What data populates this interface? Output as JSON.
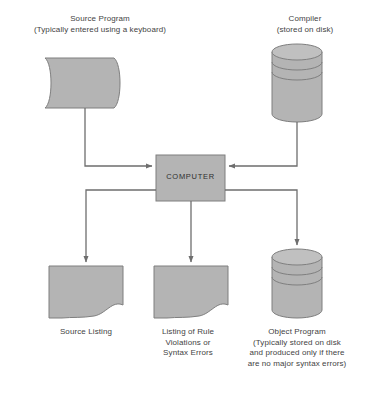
{
  "diagram": {
    "colors": {
      "shape_fill": "#b4b4b4",
      "shape_stroke": "#7f7f7f",
      "connector": "#6e6e6e",
      "text": "#434343",
      "background": "#ffffff"
    },
    "nodes": [
      {
        "id": "source-program",
        "shape": "document-card",
        "label": "Source Program\n(Typically entered using a keyboard)"
      },
      {
        "id": "compiler",
        "shape": "disk-cylinder",
        "label": "Compiler\n(stored on disk)"
      },
      {
        "id": "computer",
        "shape": "rectangle",
        "label": "COMPUTER"
      },
      {
        "id": "source-listing",
        "shape": "document",
        "label": "Source Listing"
      },
      {
        "id": "listing-of-rule-violations",
        "shape": "document",
        "label": "Listing of Rule\nViolations or\nSyntax Errors"
      },
      {
        "id": "object-program",
        "shape": "disk-cylinder",
        "label": "Object Program\n(Typically stored on disk\nand produced only if there\nare no major syntax errors)"
      }
    ],
    "connectors": [
      {
        "from": "source-program",
        "to": "computer",
        "direction": "down-right"
      },
      {
        "from": "compiler",
        "to": "computer",
        "direction": "down-left"
      },
      {
        "from": "computer",
        "to": "source-listing",
        "direction": "left-down"
      },
      {
        "from": "computer",
        "to": "listing-of-rule-violations",
        "direction": "down"
      },
      {
        "from": "computer",
        "to": "object-program",
        "direction": "right-down"
      }
    ]
  }
}
